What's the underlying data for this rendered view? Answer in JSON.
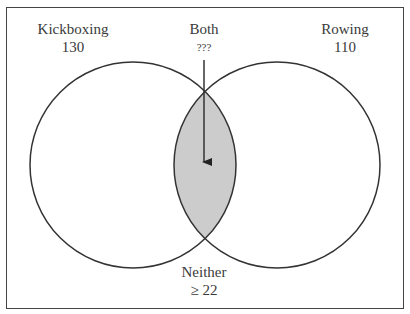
{
  "diagram": {
    "type": "venn",
    "sets": [
      {
        "name": "Kickboxing",
        "value": "130"
      },
      {
        "name": "Rowing",
        "value": "110"
      }
    ],
    "intersection": {
      "name": "Both",
      "value": "???"
    },
    "outside": {
      "name": "Neither",
      "value": "≥ 22"
    },
    "colors": {
      "stroke": "#333333",
      "intersection_fill": "#cccccc",
      "frame": "#444444"
    }
  }
}
